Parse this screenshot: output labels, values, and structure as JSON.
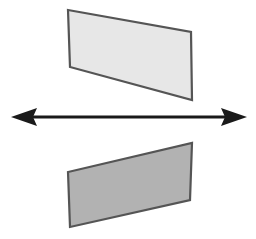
{
  "canvas": {
    "width": 256,
    "height": 239,
    "background_color": "#ffffff",
    "title": "Mirror reflection of a parallelogram across a horizontal axis"
  },
  "colors": {
    "upper_shape_fill": "#e7e7e7",
    "lower_shape_fill": "#b2b2b2",
    "shape_stroke": "#555555",
    "arrow_color": "#1a1a1a",
    "background": "#ffffff"
  },
  "shapes": {
    "upper_parallelogram": {
      "name": "upper-parallelogram",
      "fill": "#e7e7e7",
      "stroke": "#555555",
      "stroke_width": 2.2,
      "points": "68,10 191,32 192,100 70,67",
      "vertices": [
        {
          "x": 68,
          "y": 10
        },
        {
          "x": 191,
          "y": 32
        },
        {
          "x": 192,
          "y": 100
        },
        {
          "x": 70,
          "y": 67
        }
      ]
    },
    "lower_parallelogram": {
      "name": "lower-parallelogram",
      "fill": "#b2b2b2",
      "stroke": "#555555",
      "stroke_width": 2.2,
      "points": "192,143 190,200 70,227 68,172",
      "vertices": [
        {
          "x": 192,
          "y": 143
        },
        {
          "x": 190,
          "y": 200
        },
        {
          "x": 70,
          "y": 227
        },
        {
          "x": 68,
          "y": 172
        }
      ]
    }
  },
  "arrow": {
    "name": "double-headed-horizontal-arrow",
    "color": "#1a1a1a",
    "y": 117,
    "x_start": 11,
    "x_end": 247,
    "shaft_thickness": 3,
    "head_length": 26,
    "head_half_height": 9,
    "direction": "bidirectional",
    "left_head_points": "11,117 37,108 33,117 37,126",
    "right_head_points": "247,117 221,108 225,117 221,126",
    "shaft_points": "33,115.5 225,115.5 225,118.5 33,118.5"
  }
}
